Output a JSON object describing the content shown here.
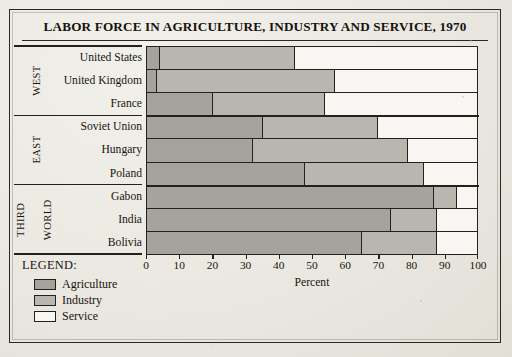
{
  "figure": {
    "title": "LABOR FORCE IN AGRICULTURE, INDUSTRY AND SERVICE, 1970",
    "legend_title": "LEGEND:"
  },
  "colors": {
    "agriculture": "#a6a39c",
    "industry": "#b9b6af",
    "service": "#f7f6f2",
    "rule": "#24211c",
    "page": "#eae8e1"
  },
  "groups": [
    {
      "label": "WEST",
      "label_lines": [
        "WEST"
      ]
    },
    {
      "label": "EAST",
      "label_lines": [
        "EAST"
      ]
    },
    {
      "label": "THIRD WORLD",
      "label_lines": [
        "THIRD",
        "WORLD"
      ]
    }
  ],
  "legend": [
    {
      "label": "Agriculture",
      "swatch": "agriculture"
    },
    {
      "label": "Industry",
      "swatch": "industry"
    },
    {
      "label": "Service",
      "swatch": "service"
    }
  ],
  "axis": {
    "title": "Percent",
    "ticks": [
      "0",
      "10",
      "20",
      "30",
      "40",
      "50",
      "60",
      "70",
      "80",
      "90",
      "100"
    ]
  },
  "rows": [
    {
      "country": "United States",
      "group": "WEST",
      "agriculture": 4,
      "industry": 41,
      "service": 55
    },
    {
      "country": "United Kingdom",
      "group": "WEST",
      "agriculture": 3,
      "industry": 54,
      "service": 43
    },
    {
      "country": "France",
      "group": "WEST",
      "agriculture": 20,
      "industry": 34,
      "service": 46
    },
    {
      "country": "Soviet Union",
      "group": "EAST",
      "agriculture": 35,
      "industry": 35,
      "service": 30
    },
    {
      "country": "Hungary",
      "group": "EAST",
      "agriculture": 32,
      "industry": 47,
      "service": 21
    },
    {
      "country": "Poland",
      "group": "EAST",
      "agriculture": 48,
      "industry": 36,
      "service": 16
    },
    {
      "country": "Gabon",
      "group": "THIRD WORLD",
      "agriculture": 87,
      "industry": 7,
      "service": 6
    },
    {
      "country": "India",
      "group": "THIRD WORLD",
      "agriculture": 74,
      "industry": 14,
      "service": 12
    },
    {
      "country": "Bolivia",
      "group": "THIRD WORLD",
      "agriculture": 65,
      "industry": 23,
      "service": 12
    }
  ],
  "chart_data": {
    "type": "bar",
    "orientation": "horizontal",
    "stacked": true,
    "normalized": true,
    "title": "LABOR FORCE IN AGRICULTURE, INDUSTRY AND SERVICE, 1970",
    "xlabel": "Percent",
    "ylabel": "",
    "xlim": [
      0,
      100
    ],
    "xticks": [
      0,
      10,
      20,
      30,
      40,
      50,
      60,
      70,
      80,
      90,
      100
    ],
    "grid": false,
    "legend_position": "below-left",
    "categories": [
      "United States",
      "United Kingdom",
      "France",
      "Soviet Union",
      "Hungary",
      "Poland",
      "Gabon",
      "India",
      "Bolivia"
    ],
    "category_groups": [
      "WEST",
      "WEST",
      "WEST",
      "EAST",
      "EAST",
      "EAST",
      "THIRD WORLD",
      "THIRD WORLD",
      "THIRD WORLD"
    ],
    "series": [
      {
        "name": "Agriculture",
        "color": "#a6a39c",
        "values": [
          4,
          3,
          20,
          35,
          32,
          48,
          87,
          74,
          65
        ]
      },
      {
        "name": "Industry",
        "color": "#b9b6af",
        "values": [
          41,
          54,
          34,
          35,
          47,
          36,
          7,
          14,
          23
        ]
      },
      {
        "name": "Service",
        "color": "#f7f6f2",
        "values": [
          55,
          43,
          46,
          30,
          21,
          16,
          6,
          12,
          12
        ]
      }
    ]
  }
}
